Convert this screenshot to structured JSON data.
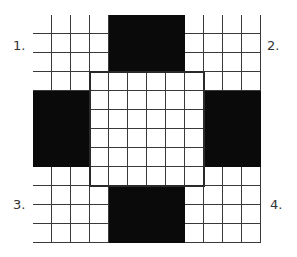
{
  "labels": [
    "1.",
    "2.",
    "3.",
    "4."
  ],
  "grid": {
    "cols": 12,
    "rows": 12,
    "cell_size_px": 19,
    "black_blocks": [
      {
        "name": "top",
        "col": 4,
        "row": 0,
        "w": 4,
        "h": 3
      },
      {
        "name": "left",
        "col": 0,
        "row": 4,
        "w": 3,
        "h": 4
      },
      {
        "name": "right",
        "col": 9,
        "row": 4,
        "w": 3,
        "h": 4
      },
      {
        "name": "bottom",
        "col": 4,
        "row": 9,
        "w": 4,
        "h": 3
      }
    ],
    "center_region": {
      "col": 3,
      "row": 3,
      "w": 6,
      "h": 6
    }
  },
  "colors": {
    "fill": "#0a0a0a",
    "line": "#3a3a3a",
    "background": "#ffffff"
  }
}
